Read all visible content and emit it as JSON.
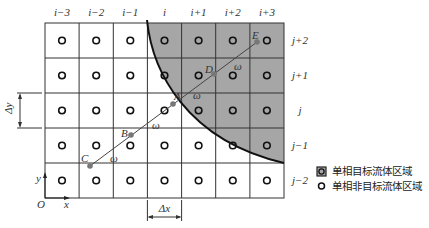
{
  "figure": {
    "column_labels": [
      "i−3",
      "i−2",
      "i−1",
      "i",
      "i+1",
      "i+2",
      "i+3"
    ],
    "row_labels": [
      "j+2",
      "j+1",
      "j",
      "j−1",
      "j−2"
    ],
    "points": [
      {
        "name": "C",
        "label": "C"
      },
      {
        "name": "B",
        "label": "B"
      },
      {
        "name": "A",
        "label": "A"
      },
      {
        "name": "D",
        "label": "D"
      },
      {
        "name": "E",
        "label": "E"
      }
    ],
    "segment_label": "ω",
    "axes": {
      "origin": "O",
      "x": "x",
      "y": "y"
    },
    "dimensions": {
      "dx": "Δx",
      "dy": "Δy"
    },
    "colors": {
      "target_region": "#a6a6a6",
      "grid": "#333333",
      "line": "#444444",
      "marker": "#777777"
    }
  },
  "legend": {
    "items": [
      {
        "icon": "shaded-square-circle-icon",
        "label": "单相目标流体区域"
      },
      {
        "icon": "circle-icon",
        "label": "单相非目标流体区域"
      }
    ]
  }
}
